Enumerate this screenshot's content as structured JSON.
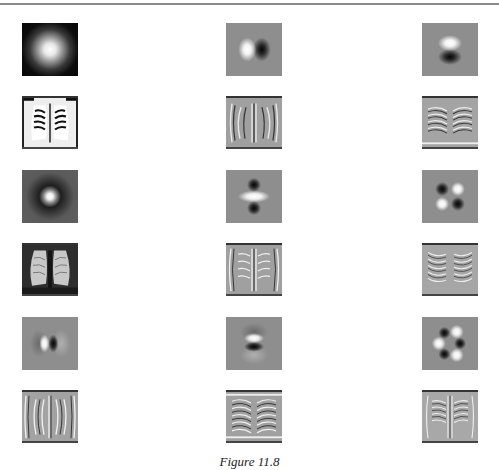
{
  "figure": {
    "caption": "Figure 11.8",
    "layout": {
      "columns": 3,
      "rows": 6
    },
    "rows": [
      {
        "type": "kernel",
        "tiles": [
          {
            "name": "gaussian-kernel",
            "kernel": "G"
          },
          {
            "name": "gaussian-dx-kernel",
            "kernel": "Gx"
          },
          {
            "name": "gaussian-dy-kernel",
            "kernel": "Gy"
          }
        ]
      },
      {
        "type": "filtered-xray",
        "tiles": [
          {
            "name": "xray-filtered-gaussian",
            "tone": "light"
          },
          {
            "name": "xray-filtered-dx",
            "tone": "mid"
          },
          {
            "name": "xray-filtered-dy",
            "tone": "mid"
          }
        ]
      },
      {
        "type": "kernel",
        "tiles": [
          {
            "name": "laplacian-kernel",
            "kernel": "LoG"
          },
          {
            "name": "gaussian-dxx-kernel",
            "kernel": "Gxx"
          },
          {
            "name": "gaussian-dxy-kernel",
            "kernel": "Gxy"
          }
        ]
      },
      {
        "type": "filtered-xray",
        "tiles": [
          {
            "name": "xray-filtered-laplacian",
            "tone": "dark"
          },
          {
            "name": "xray-filtered-dxx",
            "tone": "mid"
          },
          {
            "name": "xray-filtered-dxy",
            "tone": "mid"
          }
        ]
      },
      {
        "type": "kernel",
        "tiles": [
          {
            "name": "gaussian-dxxx-kernel",
            "kernel": "Gxxx"
          },
          {
            "name": "gaussian-dyyy-kernel",
            "kernel": "Gyyy"
          },
          {
            "name": "gaussian-third-order-mixed-kernel",
            "kernel": "Gxxy"
          }
        ]
      },
      {
        "type": "filtered-xray",
        "tiles": [
          {
            "name": "xray-filtered-dxxx",
            "tone": "mid"
          },
          {
            "name": "xray-filtered-dyyy",
            "tone": "mid"
          },
          {
            "name": "xray-filtered-third-order-mixed",
            "tone": "mid"
          }
        ]
      }
    ]
  }
}
